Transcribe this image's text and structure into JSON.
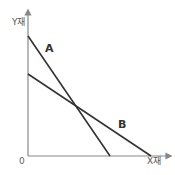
{
  "diagram": {
    "type": "budget-line-comparison",
    "y_axis_label": "Y재",
    "x_axis_label": "X재",
    "origin_label": "0",
    "lines": [
      {
        "name": "A",
        "label": "A",
        "y_intercept_px": [
          28,
          36
        ],
        "x_intercept_px": [
          110,
          156
        ]
      },
      {
        "name": "B",
        "label": "B",
        "y_intercept_px": [
          28,
          74
        ],
        "x_intercept_px": [
          151,
          156
        ]
      }
    ],
    "colors": {
      "axis": "#888888",
      "line": "#333333"
    }
  }
}
